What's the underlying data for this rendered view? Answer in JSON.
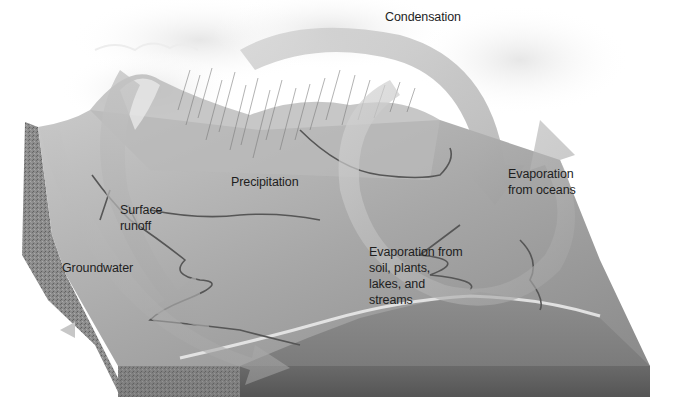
{
  "diagram": {
    "style": "grayscale",
    "colors": {
      "background": "#ffffff",
      "land_surface": "#a9a9a9",
      "land_front_face": "#5e5e5e",
      "land_side_face": "#7a7a7a",
      "arrow_fill": "#bdbdbd",
      "stream": "#555555",
      "label_text": "#1e1e1e"
    },
    "labels": {
      "condensation": {
        "lines": [
          "Condensation"
        ]
      },
      "precipitation": {
        "lines": [
          "Precipitation"
        ]
      },
      "evaporation_oceans": {
        "lines": [
          "Evaporation",
          "from oceans"
        ]
      },
      "surface_runoff": {
        "lines": [
          "Surface",
          "runoff"
        ]
      },
      "groundwater": {
        "lines": [
          "Groundwater"
        ]
      },
      "evaporation_land": {
        "lines": [
          "Evaporation from",
          "soil, plants,",
          "lakes, and",
          "streams"
        ]
      }
    }
  }
}
